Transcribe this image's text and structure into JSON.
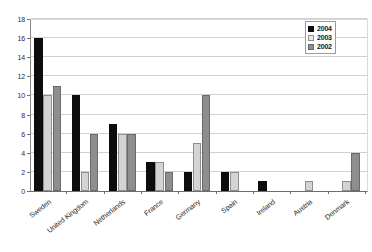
{
  "chart_data": {
    "type": "bar",
    "title": "",
    "subtitle": "",
    "xlabel": "",
    "ylabel": "",
    "ylim": [
      0,
      18
    ],
    "ytick_step": 2,
    "yticks": [
      0,
      2,
      4,
      6,
      8,
      10,
      12,
      14,
      16,
      18
    ],
    "grid": true,
    "grid_axis": "y",
    "legend_position": "top-right",
    "categories": [
      "Sweden",
      "United Kingdom",
      "Netherlands",
      "France",
      "Germany",
      "Spain",
      "Ireland",
      "Austria",
      "Denmark"
    ],
    "series": [
      {
        "name": "2004",
        "color": "#0d0d0d",
        "values": [
          16,
          10,
          7,
          3,
          2,
          2,
          1,
          0,
          0
        ]
      },
      {
        "name": "2003",
        "color": "#d4d4d4",
        "values": [
          10,
          2,
          6,
          3,
          5,
          2,
          0,
          1,
          1
        ]
      },
      {
        "name": "2002",
        "color": "#8e8e8e",
        "values": [
          11,
          6,
          6,
          2,
          10,
          0,
          0,
          0,
          4
        ]
      }
    ]
  },
  "legend": {
    "items": [
      {
        "label": "2004",
        "series_key": "s2004"
      },
      {
        "label": "2003",
        "series_key": "s2003"
      },
      {
        "label": "2002",
        "series_key": "s2002"
      }
    ]
  },
  "colors": {
    "series_2004": "#0d0d0d",
    "series_2003": "#d4d4d4",
    "series_2002": "#8e8e8e",
    "gridline": "#d0d0d0",
    "axis": "#6e6e6e",
    "text": "#2b2b2b",
    "background": "#ffffff"
  }
}
